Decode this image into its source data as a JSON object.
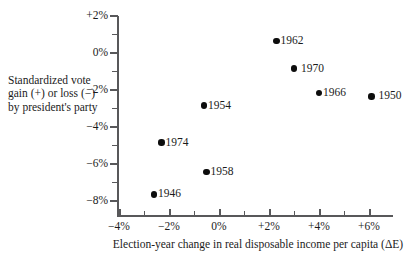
{
  "chart_data": {
    "type": "scatter",
    "title": "",
    "xlabel": "Election-year change in real disposable income per capita (ΔE)",
    "ylabel": "Standardized vote gain (+) or loss (−) by president's party",
    "xlim": [
      -4,
      6.9
    ],
    "ylim": [
      -8,
      2
    ],
    "grid": false,
    "legend": "none",
    "xticks": [
      "−4%",
      "−2%",
      "0%",
      "+2%",
      "+4%",
      "+6%"
    ],
    "xtick_values": [
      -4,
      -2,
      0,
      2,
      4,
      6
    ],
    "yticks": [
      "+2%",
      "0%",
      "−2%",
      "−4%",
      "−6%",
      "−8%"
    ],
    "ytick_values": [
      2,
      0,
      -2,
      -4,
      -6,
      -8
    ],
    "xminor_step": 1,
    "yminor_step": 1,
    "points": [
      {
        "label": "1962",
        "x": 2.3,
        "y": 0.6,
        "label_gap": false
      },
      {
        "label": "1970",
        "x": 3.0,
        "y": -0.9,
        "label_gap": true
      },
      {
        "label": "1966",
        "x": 4.0,
        "y": -2.2,
        "label_gap": false
      },
      {
        "label": "1950",
        "x": 6.1,
        "y": -2.4,
        "label_gap": true
      },
      {
        "label": "1954",
        "x": -0.6,
        "y": -2.9,
        "label_gap": false
      },
      {
        "label": "1974",
        "x": -2.3,
        "y": -4.9,
        "label_gap": false
      },
      {
        "label": "1958",
        "x": -0.5,
        "y": -6.5,
        "label_gap": false
      },
      {
        "label": "1946",
        "x": -2.6,
        "y": -7.7,
        "label_gap": false
      }
    ],
    "colors": {
      "point": "#0d0d0d",
      "axis": "#58585a",
      "text": "#1b1b1b",
      "background": "#ffffff"
    }
  }
}
